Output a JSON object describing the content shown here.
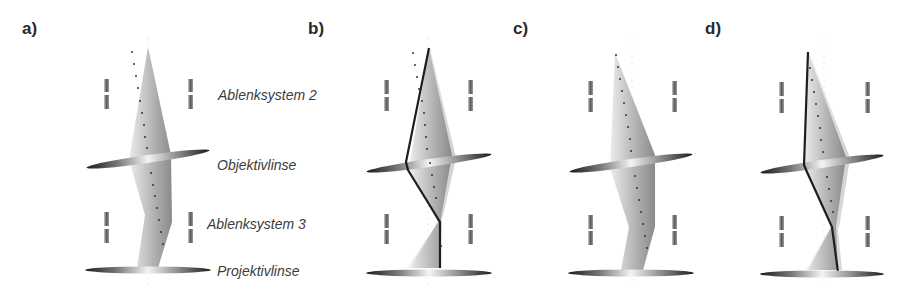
{
  "panels": [
    {
      "id": "a",
      "label": "a)",
      "axis_x": 148
    },
    {
      "id": "b",
      "label": "b)",
      "axis_x": 428
    },
    {
      "id": "c",
      "label": "c)",
      "axis_x": 628
    },
    {
      "id": "d",
      "label": "d)",
      "axis_x": 823
    }
  ],
  "components": {
    "deflector_2": "Ablenksystem 2",
    "objective_lens": "Objektivlinse",
    "deflector_3": "Ablenksystem 3",
    "projective_lens": "Projektivlinse"
  },
  "colors": {
    "beam_light": "#e6e6e6",
    "beam_dark": "#8c8c8c",
    "ray_line": "#1e1e1e",
    "dots": "#333333",
    "text": "#3c3c3c"
  }
}
